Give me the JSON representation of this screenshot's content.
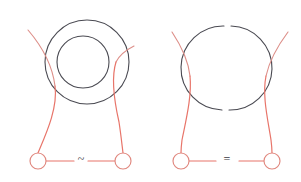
{
  "figure": {
    "title": "",
    "background_color": "#ffffff",
    "width": 301,
    "height": 182,
    "colors": {
      "red": "#e8756a",
      "red_soft": "#dd8f89",
      "dark": "#4a4a52",
      "node_stroke": "#e0877e",
      "node_fill": "#ffffff",
      "symbol": "#3a3a42"
    }
  },
  "left_diagram": {
    "name": "left-knot-diagram",
    "relation_symbol": "~",
    "relation_symbol_name": "tilde-equivalence-symbol",
    "nodes": [
      {
        "label": "",
        "cx": 38,
        "cy": 161,
        "r": 8
      },
      {
        "label": "",
        "cx": 123,
        "cy": 161,
        "r": 8
      }
    ],
    "circles": [
      {
        "name": "outer-circle",
        "cx": 87,
        "cy": 62,
        "r": 42
      },
      {
        "name": "inner-circle",
        "cx": 83,
        "cy": 62,
        "r": 26
      }
    ],
    "baseline": {
      "x1": 46,
      "y1": 161,
      "x2": 115,
      "y2": 161
    }
  },
  "right_diagram": {
    "name": "right-knot-diagram",
    "relation_symbol": "=",
    "relation_symbol_name": "equals-symbol",
    "nodes": [
      {
        "label": "",
        "cx": 181,
        "cy": 161,
        "r": 8
      },
      {
        "label": "",
        "cx": 272,
        "cy": 161,
        "r": 8
      }
    ],
    "circles": [
      {
        "name": "main-circle",
        "cx": 227,
        "cy": 68,
        "r": 42
      }
    ],
    "baseline": {
      "x1": 189,
      "y1": 161,
      "x2": 264,
      "y2": 161
    }
  }
}
